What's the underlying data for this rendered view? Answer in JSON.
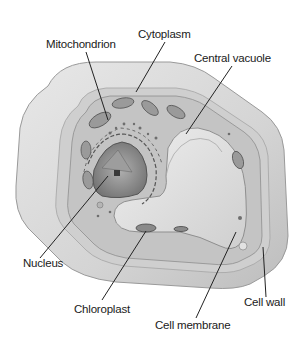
{
  "diagram": {
    "labels": {
      "mitochondrion": "Mitochondrion",
      "cytoplasm": "Cytoplasm",
      "central_vacuole": "Central vacuole",
      "nucleus": "Nucleus",
      "chloroplast": "Chloroplast",
      "cell_membrane": "Cell membrane",
      "cell_wall": "Cell wall"
    },
    "colors": {
      "background": "#ffffff",
      "cell_wall": "#d9d9d9",
      "cytoplasm": "#c9c9c9",
      "vacuole": "#e4e4e4",
      "organelle": "#8a8a8a",
      "label_text": "#1a1a1a"
    }
  }
}
